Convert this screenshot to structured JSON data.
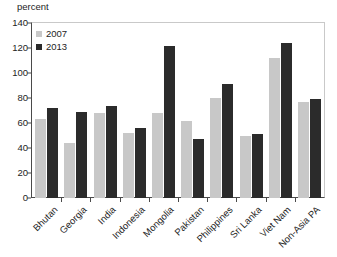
{
  "chart_data": {
    "type": "bar",
    "title": "",
    "subtitle": "",
    "xlabel": "",
    "ylabel": "percent",
    "ylim": [
      0,
      140
    ],
    "yticks": [
      0,
      20,
      40,
      60,
      80,
      100,
      120,
      140
    ],
    "grid": false,
    "legend_position": "top-left",
    "categories": [
      "Bhutan",
      "Georgia",
      "India",
      "Indonesia",
      "Mongolia",
      "Pakistan",
      "Philippines",
      "Sri Lanka",
      "Viet Nam",
      "Non-Asia PA"
    ],
    "series": [
      {
        "name": "2007",
        "color": "#c8c8c8",
        "values": [
          63,
          44,
          68,
          52,
          68,
          62,
          80,
          50,
          112,
          77
        ]
      },
      {
        "name": "2013",
        "color": "#2b2b2b",
        "values": [
          72,
          69,
          74,
          56,
          122,
          47,
          91,
          51,
          124,
          79
        ]
      }
    ]
  },
  "axis": {
    "unit_label": "percent"
  }
}
